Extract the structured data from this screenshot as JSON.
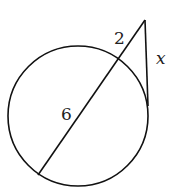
{
  "diagram": {
    "circle": {
      "cx": 78,
      "cy": 116,
      "r": 70
    },
    "external_point": {
      "x": 145,
      "y": 20
    },
    "secant": {
      "outer_intersection": {
        "x": 120,
        "y": 60
      },
      "far_intersection": {
        "x": 38,
        "y": 175
      }
    },
    "tangent_point": {
      "x": 148,
      "y": 106
    },
    "labels": {
      "external_segment": "2",
      "internal_segment": "6",
      "tangent_segment": "x"
    },
    "stroke_color": "#111111"
  }
}
